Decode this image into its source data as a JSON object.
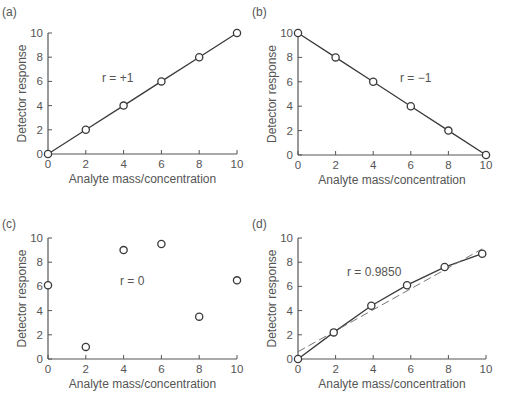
{
  "chart_data": [
    {
      "panel": "(a)",
      "type": "line",
      "xlabel": "Analyte mass/concentration",
      "ylabel": "Detector response",
      "xlim": [
        0,
        10
      ],
      "ylim": [
        0,
        10
      ],
      "xticks": [
        "0",
        "2",
        "4",
        "6",
        "8",
        "10"
      ],
      "yticks": [
        "0",
        "2",
        "4",
        "6",
        "8",
        "10"
      ],
      "annotation": "r = +1",
      "series": [
        {
          "name": "data",
          "x": [
            0,
            2,
            4,
            6,
            8,
            10
          ],
          "y": [
            0,
            2,
            4,
            6,
            8,
            10
          ],
          "markers": true,
          "connected": true
        }
      ],
      "grid": false
    },
    {
      "panel": "(b)",
      "type": "line",
      "xlabel": "Analyte mass/concentration",
      "ylabel": "Detector response",
      "xlim": [
        0,
        10
      ],
      "ylim": [
        0,
        10
      ],
      "xticks": [
        "0",
        "2",
        "4",
        "6",
        "8",
        "10"
      ],
      "yticks": [
        "0",
        "2",
        "4",
        "6",
        "8",
        "10"
      ],
      "annotation": "r = −1",
      "series": [
        {
          "name": "data",
          "x": [
            0,
            2,
            4,
            6,
            8,
            10
          ],
          "y": [
            10,
            8,
            6,
            4,
            2,
            0
          ],
          "markers": true,
          "connected": true
        }
      ],
      "grid": false
    },
    {
      "panel": "(c)",
      "type": "scatter",
      "xlabel": "Analyte mass/concentration",
      "ylabel": "Detector response",
      "xlim": [
        0,
        10
      ],
      "ylim": [
        0,
        10
      ],
      "xticks": [
        "0",
        "2",
        "4",
        "6",
        "8",
        "10"
      ],
      "yticks": [
        "0",
        "2",
        "4",
        "6",
        "8",
        "10"
      ],
      "annotation": "r = 0",
      "series": [
        {
          "name": "data",
          "x": [
            0,
            2,
            4,
            6,
            8,
            10
          ],
          "y": [
            6.1,
            1.0,
            9.0,
            9.5,
            3.5,
            6.5
          ],
          "markers": true,
          "connected": false
        }
      ],
      "grid": false
    },
    {
      "panel": "(d)",
      "type": "line",
      "xlabel": "Analyte mass/concentration",
      "ylabel": "Detector response",
      "xlim": [
        0,
        10
      ],
      "ylim": [
        0,
        10
      ],
      "xticks": [
        "0",
        "2",
        "4",
        "6",
        "8",
        "10"
      ],
      "yticks": [
        "0",
        "2",
        "4",
        "6",
        "8",
        "10"
      ],
      "annotation": "r = 0.9850",
      "series": [
        {
          "name": "data",
          "x": [
            0,
            1.9,
            3.9,
            5.8,
            7.8,
            9.8
          ],
          "y": [
            0,
            2.2,
            4.4,
            6.1,
            7.6,
            8.7
          ],
          "markers": true,
          "connected": true
        },
        {
          "name": "linear fit (dashed)",
          "x": [
            0,
            9.8
          ],
          "y": [
            0.6,
            9.1
          ],
          "markers": false,
          "connected": true,
          "style": "dashed"
        }
      ],
      "grid": false
    }
  ],
  "panels": [
    {
      "label": "(a)",
      "annotation": "r = +1",
      "xlabel": "Analyte mass/concentration",
      "ylabel": "Detector response"
    },
    {
      "label": "(b)",
      "annotation": "r = −1",
      "xlabel": "Analyte mass/concentration",
      "ylabel": "Detector response"
    },
    {
      "label": "(c)",
      "annotation": "r = 0",
      "xlabel": "Analyte mass/concentration",
      "ylabel": "Detector response"
    },
    {
      "label": "(d)",
      "annotation": "r = 0.9850",
      "xlabel": "Analyte mass/concentration",
      "ylabel": "Detector response"
    }
  ]
}
